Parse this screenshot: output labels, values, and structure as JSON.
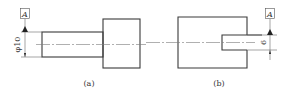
{
  "figures": [
    {
      "id": "a",
      "caption": "(a)",
      "datum_label": "A",
      "dimension_text": "φ10",
      "description": "Stepped shaft with datum A applied to diameter φ10"
    },
    {
      "id": "b",
      "caption": "(b)",
      "datum_label": "A",
      "dimension_text": "6",
      "description": "Block with slot, datum A applied to slot width 6"
    }
  ],
  "colors": {
    "line": "#3a3a3a",
    "background": "#ffffff"
  }
}
